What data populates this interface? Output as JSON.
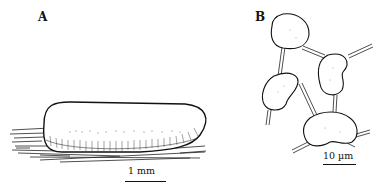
{
  "figure": {
    "top_cutoff_text": "· · ·",
    "panels": [
      {
        "label": "A",
        "subject": "elongated oval egg on leaf/stem surface",
        "scale_label": "1 mm"
      },
      {
        "label": "B",
        "subject": "four cells connected by double-line threads",
        "scale_label": "10 µm"
      }
    ]
  }
}
